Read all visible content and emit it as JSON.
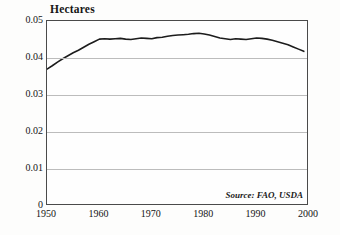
{
  "chart_data": {
    "type": "line",
    "title": "Hectares",
    "xlabel": "",
    "ylabel": "Hectares",
    "xlim": [
      1950,
      2000
    ],
    "ylim": [
      0,
      0.05
    ],
    "grid": true,
    "legend": null,
    "annotations": [
      {
        "name": "source-note",
        "text": "Source: FAO, USDA",
        "position": "bottom-right-inside"
      }
    ],
    "yticks": [
      "0",
      "0.01",
      "0.02",
      "0.03",
      "0.04",
      "0.05"
    ],
    "ytick_values": [
      0,
      0.01,
      0.02,
      0.03,
      0.04,
      0.05
    ],
    "xticks": [
      "1950",
      "1960",
      "1970",
      "1980",
      "1990",
      "2000"
    ],
    "xtick_values": [
      1950,
      1960,
      1970,
      1980,
      1990,
      2000
    ],
    "line_color": "#1c1c1c",
    "grid_color": "#bcbcbc",
    "series": [
      {
        "name": "Grain area per person",
        "x": [
          1950,
          1951,
          1952,
          1953,
          1954,
          1955,
          1956,
          1957,
          1958,
          1959,
          1960,
          1961,
          1962,
          1963,
          1964,
          1965,
          1966,
          1967,
          1968,
          1969,
          1970,
          1971,
          1972,
          1973,
          1974,
          1975,
          1976,
          1977,
          1978,
          1979,
          1980,
          1981,
          1982,
          1983,
          1984,
          1985,
          1986,
          1987,
          1988,
          1989,
          1990,
          1991,
          1992,
          1993,
          1994,
          1995,
          1996,
          1997,
          1998,
          1999
        ],
        "values": [
          0.037,
          0.0379,
          0.0389,
          0.0398,
          0.0406,
          0.0414,
          0.0421,
          0.0429,
          0.0437,
          0.0444,
          0.0451,
          0.0452,
          0.0451,
          0.0452,
          0.0453,
          0.0451,
          0.045,
          0.0452,
          0.0454,
          0.0453,
          0.0452,
          0.0455,
          0.0456,
          0.0459,
          0.0461,
          0.0462,
          0.0463,
          0.0464,
          0.0466,
          0.0467,
          0.0465,
          0.0462,
          0.0458,
          0.0454,
          0.0452,
          0.045,
          0.0452,
          0.0451,
          0.045,
          0.0452,
          0.0454,
          0.0453,
          0.0451,
          0.0448,
          0.0444,
          0.044,
          0.0436,
          0.043,
          0.0424,
          0.0418
        ]
      }
    ]
  }
}
